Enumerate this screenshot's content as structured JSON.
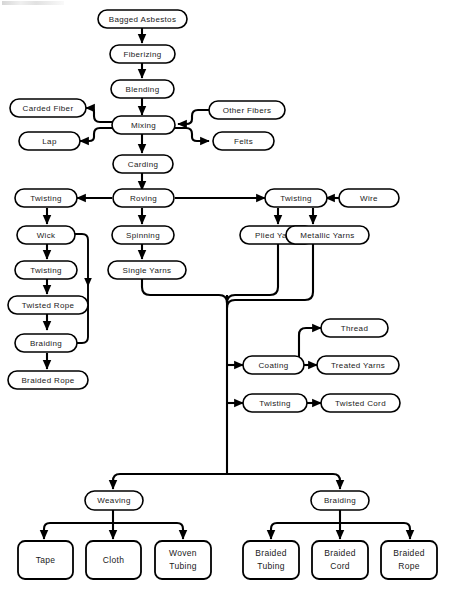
{
  "diagram": {
    "colors": {
      "background": "#ffffff",
      "stroke": "#000000",
      "text": "#1a1a1a"
    },
    "nodes": {
      "bagged_asbestos": "Bagged Asbestos",
      "fiberizing": "Fiberizing",
      "blending": "Blending",
      "carded_fiber": "Carded Fiber",
      "mixing": "Mixing",
      "other_fibers": "Other Fibers",
      "lap": "Lap",
      "felts": "Felts",
      "carding": "Carding",
      "twisting_left": "Twisting",
      "roving": "Roving",
      "twisting_right": "Twisting",
      "wire": "Wire",
      "wick": "Wick",
      "spinning": "Spinning",
      "plied_yarns": "Plied Yarns",
      "metallic_yarns": "Metallic Yarns",
      "twisting_left2": "Twisting",
      "single_yarns": "Single Yarns",
      "twisted_rope": "Twisted Rope",
      "thread": "Thread",
      "braiding_left": "Braiding",
      "coating": "Coating",
      "treated_yarns": "Treated Yarns",
      "braided_rope_left": "Braided Rope",
      "twisting_cord": "Twisting",
      "twisted_cord": "Twisted Cord",
      "weaving": "Weaving",
      "braiding_bottom": "Braiding",
      "tape": "Tape",
      "cloth": "Cloth",
      "woven_tubing_l1": "Woven",
      "woven_tubing_l2": "Tubing",
      "braided_tubing_l1": "Braided",
      "braided_tubing_l2": "Tubing",
      "braided_cord_l1": "Braided",
      "braided_cord_l2": "Cord",
      "braided_rope_l1": "Braided",
      "braided_rope_l2": "Rope"
    }
  }
}
